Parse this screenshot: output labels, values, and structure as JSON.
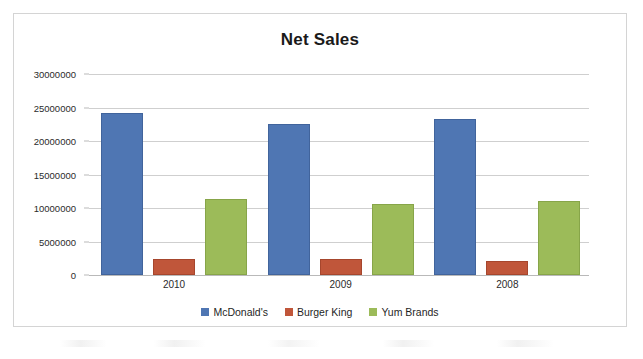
{
  "chart_data": {
    "type": "bar",
    "title": "Net Sales",
    "xlabel": "",
    "ylabel": "",
    "categories": [
      "2010",
      "2009",
      "2008"
    ],
    "series": [
      {
        "name": "McDonald's",
        "color": "#4f76b3",
        "values": [
          24200000,
          22500000,
          23300000
        ]
      },
      {
        "name": "Burger King",
        "color": "#c0563a",
        "values": [
          2400000,
          2350000,
          2150000
        ]
      },
      {
        "name": "Yum Brands",
        "color": "#9cbb59",
        "values": [
          11300000,
          10600000,
          11000000
        ]
      }
    ],
    "ylim": [
      0,
      30000000
    ],
    "ytick_step": 5000000,
    "yticks": [
      0,
      5000000,
      10000000,
      15000000,
      20000000,
      25000000,
      30000000
    ],
    "ytick_labels": [
      "0",
      "5000000",
      "10000000",
      "15000000",
      "20000000",
      "25000000",
      "30000000"
    ],
    "grid": true,
    "legend_position": "bottom",
    "background_color": "#ffffff",
    "gridline_color": "#cfcfcf",
    "border_color": "#d4d4d4"
  }
}
